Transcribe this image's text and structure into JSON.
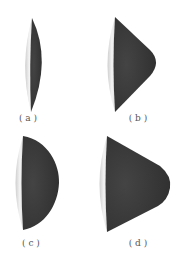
{
  "figure": {
    "panels": [
      {
        "id": "a",
        "label": "( a )",
        "description": "thin biconvex lens-like cap"
      },
      {
        "id": "b",
        "label": "( b )",
        "description": "cone-like cap with rounded nose"
      },
      {
        "id": "c",
        "label": "( c )",
        "description": "hemispherical cap"
      },
      {
        "id": "d",
        "label": "( d )",
        "description": "truncated cone cap with rounded nose"
      }
    ],
    "colors": {
      "dark_body": "#3a3a3a",
      "dark_body_edge": "#2a2a2a",
      "light_face": "#e8e8e8",
      "light_face_shadow": "#bdbdbd",
      "background": "#ffffff"
    }
  }
}
